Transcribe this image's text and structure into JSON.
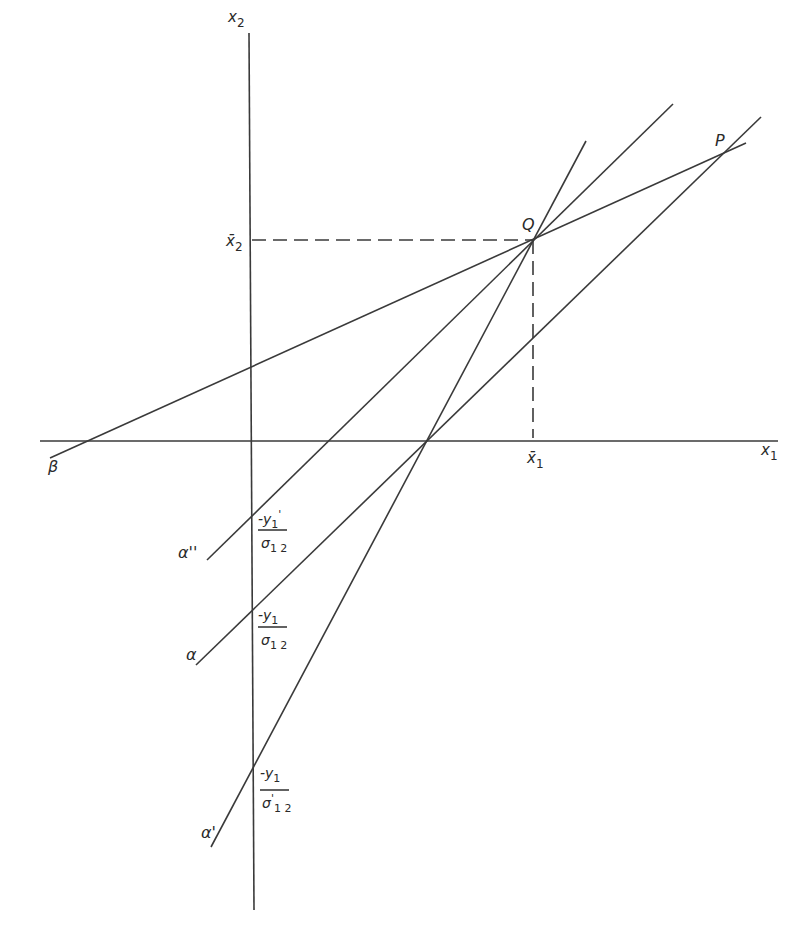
{
  "diagram": {
    "type": "geometric-construction",
    "axes": {
      "x_label": "x",
      "x_sub": "1",
      "y_label": "x",
      "y_sub": "2"
    },
    "points": {
      "Q": "Q",
      "P": "P"
    },
    "means": {
      "x1bar": "x̄",
      "x1bar_sub": "1",
      "x2bar": "x̄",
      "x2bar_sub": "2"
    },
    "lines": [
      {
        "id": "beta",
        "label": "β"
      },
      {
        "id": "alpha-double-prime",
        "label": "α''"
      },
      {
        "id": "alpha",
        "label": "α"
      },
      {
        "id": "alpha-prime",
        "label": "α'"
      }
    ],
    "intercepts": [
      {
        "numerator": "-y",
        "num_sub": "1",
        "num_prime": "'",
        "denominator": "σ",
        "den_sub": "1 2",
        "den_prime": ""
      },
      {
        "numerator": "-y",
        "num_sub": "1",
        "num_prime": "",
        "denominator": "σ",
        "den_sub": "1 2",
        "den_prime": ""
      },
      {
        "numerator": "-y",
        "num_sub": "1",
        "num_prime": "",
        "denominator": "σ",
        "den_sub": "1 2",
        "den_prime": "'"
      }
    ],
    "colors": {
      "ink": "#3a3a3a",
      "background": "#ffffff"
    }
  }
}
